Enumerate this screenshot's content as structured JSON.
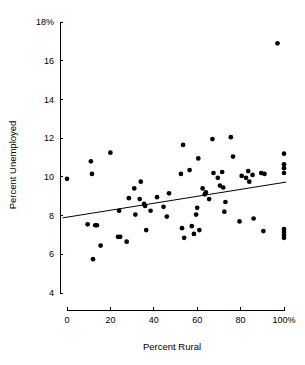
{
  "chart_data": {
    "type": "scatter",
    "title": "",
    "xlabel": "Percent Rural",
    "ylabel": "Percent Unemployed",
    "xlim": [
      -4,
      104
    ],
    "ylim": [
      4,
      18
    ],
    "grid": false,
    "legend": null,
    "x_ticks": [
      0,
      20,
      40,
      60,
      80,
      100
    ],
    "x_tick_labels": [
      "0",
      "20",
      "40",
      "60",
      "80",
      "100%"
    ],
    "y_ticks": [
      4,
      6,
      8,
      10,
      12,
      14,
      16,
      18
    ],
    "y_tick_labels": [
      "4",
      "6",
      "8",
      "10",
      "12",
      "14",
      "16",
      "18%"
    ],
    "marker": "filled-circle",
    "marker_color": "#000000",
    "points": [
      [
        0.0,
        9.9
      ],
      [
        9.5,
        7.55
      ],
      [
        11.0,
        10.8
      ],
      [
        11.5,
        10.15
      ],
      [
        12.0,
        5.75
      ],
      [
        13.0,
        7.5
      ],
      [
        13.8,
        7.5
      ],
      [
        15.5,
        6.45
      ],
      [
        20.0,
        11.25
      ],
      [
        23.5,
        6.9
      ],
      [
        24.5,
        6.9
      ],
      [
        24.0,
        8.25
      ],
      [
        27.5,
        6.65
      ],
      [
        28.5,
        8.9
      ],
      [
        31.0,
        9.4
      ],
      [
        31.5,
        8.05
      ],
      [
        33.5,
        8.85
      ],
      [
        34.0,
        9.75
      ],
      [
        35.5,
        8.6
      ],
      [
        36.0,
        8.5
      ],
      [
        36.5,
        7.25
      ],
      [
        38.5,
        8.25
      ],
      [
        41.5,
        8.95
      ],
      [
        44.5,
        8.45
      ],
      [
        46.0,
        7.95
      ],
      [
        47.0,
        9.15
      ],
      [
        52.5,
        10.15
      ],
      [
        53.0,
        7.35
      ],
      [
        53.5,
        11.65
      ],
      [
        54.0,
        6.85
      ],
      [
        56.5,
        10.35
      ],
      [
        57.5,
        7.45
      ],
      [
        58.5,
        7.05
      ],
      [
        59.5,
        8.05
      ],
      [
        60.0,
        8.4
      ],
      [
        60.5,
        10.95
      ],
      [
        61.0,
        7.25
      ],
      [
        62.5,
        9.4
      ],
      [
        63.5,
        9.1
      ],
      [
        64.0,
        9.2
      ],
      [
        65.5,
        8.85
      ],
      [
        67.0,
        11.95
      ],
      [
        67.5,
        10.2
      ],
      [
        69.5,
        9.95
      ],
      [
        70.5,
        9.55
      ],
      [
        71.5,
        10.25
      ],
      [
        72.0,
        9.45
      ],
      [
        72.5,
        8.2
      ],
      [
        73.0,
        8.7
      ],
      [
        75.5,
        12.05
      ],
      [
        76.5,
        11.05
      ],
      [
        79.5,
        7.7
      ],
      [
        80.5,
        10.05
      ],
      [
        82.5,
        9.95
      ],
      [
        83.5,
        10.3
      ],
      [
        84.0,
        9.75
      ],
      [
        85.5,
        10.1
      ],
      [
        86.0,
        7.85
      ],
      [
        89.5,
        10.2
      ],
      [
        90.5,
        7.2
      ],
      [
        91.0,
        10.15
      ],
      [
        97.0,
        16.9
      ],
      [
        100.0,
        11.2
      ],
      [
        100.0,
        10.65
      ],
      [
        100.0,
        10.45
      ],
      [
        100.0,
        10.2
      ],
      [
        100.0,
        7.3
      ],
      [
        100.0,
        7.15
      ],
      [
        100.0,
        7.0
      ],
      [
        100.0,
        6.85
      ]
    ],
    "fit_line": {
      "name": "least-squares regression line",
      "x_start": -2,
      "y_start": 7.88,
      "x_end": 101,
      "y_end": 9.73
    }
  }
}
